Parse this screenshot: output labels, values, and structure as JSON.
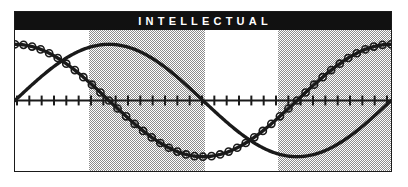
{
  "window": {
    "title": "INTELLECTUAL"
  },
  "header": {
    "title": "INTELLECTUAL",
    "background_color": "#111111",
    "text_color": "#ffffff"
  },
  "chart_frame": {
    "border_color": "#1a1a1a",
    "background_color": "#ffffff"
  },
  "chart_data": {
    "type": "line",
    "title": "INTELLECTUAL",
    "subtitle": "",
    "xlabel": "",
    "ylabel": "",
    "xlim": [
      0,
      33
    ],
    "ylim": [
      -1,
      1
    ],
    "grid": false,
    "legend": "none",
    "axis_line": {
      "y_value": 0,
      "tick_count": 31,
      "tick_length_px": 10,
      "color": "#1a1a1a"
    },
    "shaded_bands": [
      {
        "label": "band-1",
        "x_start": 6.4,
        "x_end": 16.6,
        "color": "#8c8c8c",
        "pattern": "50% dither"
      },
      {
        "label": "band-2",
        "x_start": 23.0,
        "x_end": 33.0,
        "color": "#8c8c8c",
        "pattern": "50% dither"
      }
    ],
    "series": [
      {
        "name": "intellectual-cycle-plain",
        "marker": "none",
        "line_color": "#1a1a1a",
        "line_width_px": 3.2,
        "period_units": 33,
        "phase_units": 0,
        "amplitude": 1,
        "description": "sine starting at zero rising to peak then descending through zero to trough and rising again"
      },
      {
        "name": "intellectual-cycle-marked",
        "marker": "circle",
        "marker_count": 44,
        "marker_radius_px": 3.6,
        "line_color": "#1a1a1a",
        "line_width_px": 3.2,
        "period_units": 33,
        "phase_units": 8.25,
        "amplitude": 1,
        "description": "cosine starting near peak descending through zero to trough and rising to peak at right"
      }
    ]
  }
}
